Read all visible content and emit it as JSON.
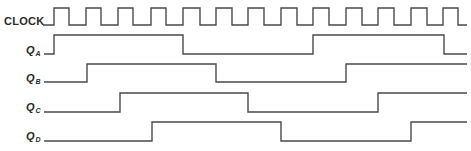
{
  "diagram": {
    "type": "timing-diagram",
    "x_end": 467,
    "stroke_color": "#4a4a4a",
    "signals": [
      {
        "id": "clock",
        "label": "CLOCK",
        "subscript": "",
        "label_top": 15,
        "high_y": 8,
        "low_y": 25,
        "start_x": 43,
        "initial": 0,
        "edges": [
          54,
          69,
          86,
          101,
          118,
          133,
          151,
          166,
          183,
          200,
          216,
          232,
          248,
          264,
          281,
          297,
          313,
          329,
          346,
          362,
          378,
          394,
          411,
          427,
          443,
          458
        ]
      },
      {
        "id": "qa",
        "label": "Q",
        "subscript": "A",
        "label_top": 44,
        "high_y": 35,
        "low_y": 54,
        "start_x": 44,
        "initial": 0,
        "edges": [
          54,
          183,
          313,
          444
        ]
      },
      {
        "id": "qb",
        "label": "Q",
        "subscript": "B",
        "label_top": 72,
        "high_y": 64,
        "low_y": 82,
        "start_x": 44,
        "initial": 0,
        "edges": [
          87,
          216,
          346
        ]
      },
      {
        "id": "qc",
        "label": "Q",
        "subscript": "C",
        "label_top": 101,
        "high_y": 93,
        "low_y": 112,
        "start_x": 44,
        "initial": 0,
        "edges": [
          120,
          248,
          378
        ]
      },
      {
        "id": "qd",
        "label": "Q",
        "subscript": "D",
        "label_top": 130,
        "high_y": 122,
        "low_y": 141,
        "start_x": 44,
        "initial": 0,
        "edges": [
          152,
          281,
          411
        ]
      }
    ]
  }
}
